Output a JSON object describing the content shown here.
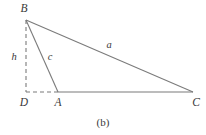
{
  "figure": {
    "caption": "(b)",
    "caption_position": {
      "x": 103,
      "y": 122
    },
    "stroke_color": "#7b7b7b",
    "label_color": "#3a3a3a",
    "background_color": "#ffffff",
    "vertices": [
      {
        "name": "B",
        "label": "B",
        "x": 26,
        "y": 20,
        "label_x": 24,
        "label_y": 9
      },
      {
        "name": "A",
        "label": "A",
        "x": 58,
        "y": 92,
        "label_x": 58,
        "label_y": 103
      },
      {
        "name": "C",
        "label": "C",
        "x": 193,
        "y": 92,
        "label_x": 196,
        "label_y": 103
      },
      {
        "name": "D",
        "label": "D",
        "x": 26,
        "y": 92,
        "label_x": 24,
        "label_y": 103
      }
    ],
    "solid_edges": [
      {
        "name": "edge-a",
        "from": "B",
        "to": "C",
        "x1": 26,
        "y1": 20,
        "x2": 193,
        "y2": 92
      },
      {
        "name": "edge-c",
        "from": "B",
        "to": "A",
        "x1": 26,
        "y1": 20,
        "x2": 58,
        "y2": 92
      },
      {
        "name": "edge-base",
        "from": "A",
        "to": "C",
        "x1": 58,
        "y1": 92,
        "x2": 193,
        "y2": 92
      }
    ],
    "dashed_edges": [
      {
        "name": "edge-h",
        "from": "B",
        "to": "D",
        "x1": 26,
        "y1": 20,
        "x2": 26,
        "y2": 92
      },
      {
        "name": "edge-da",
        "from": "D",
        "to": "A",
        "x1": 26,
        "y1": 92,
        "x2": 58,
        "y2": 92
      }
    ],
    "side_labels": [
      {
        "name": "label-h",
        "text": "h",
        "x": 14,
        "y": 57
      },
      {
        "name": "label-c",
        "text": "c",
        "x": 50,
        "y": 57
      },
      {
        "name": "label-a",
        "text": "a",
        "x": 109,
        "y": 45
      }
    ]
  }
}
